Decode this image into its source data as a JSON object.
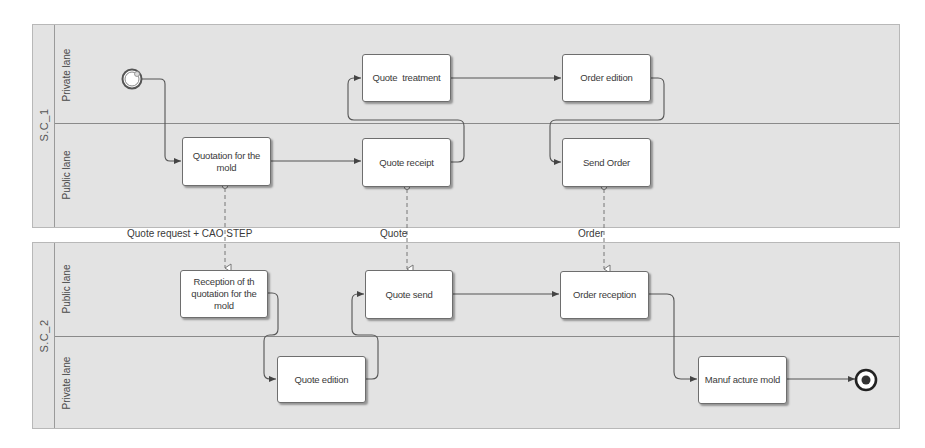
{
  "colors": {
    "pool_fill": "#e3e3e3",
    "task_fill": "#ffffff",
    "line": "#555555"
  },
  "pools": [
    {
      "id": "sc1",
      "title": "S.C_1",
      "lanes": [
        {
          "label": "Private lane"
        },
        {
          "label": "Public lane"
        }
      ]
    },
    {
      "id": "sc2",
      "title": "S.C_2",
      "lanes": [
        {
          "label": "Public lane"
        },
        {
          "label": "Private lane"
        }
      ]
    }
  ],
  "tasks": {
    "quotation_for_mold": "Quotation for the mold",
    "quote_treatment": "Quote  treatment",
    "quote_receipt": "Quote receipt",
    "order_edition": "Order edition",
    "send_order": "Send Order",
    "reception_quotation": "Reception of th quotation for the mold",
    "quote_edition": "Quote edition",
    "quote_send": "Quote send",
    "order_reception": "Order reception",
    "manufacture_mold": "Manuf acture mold"
  },
  "events": {
    "start": "start-event",
    "end": "end-event"
  },
  "message_flows": [
    {
      "label": "Quote request + CAO STEP",
      "from": "Quotation for the mold",
      "to": "Reception of th quotation for the mold"
    },
    {
      "label": "Quote",
      "from": "Quote receipt",
      "to": "Quote send"
    },
    {
      "label": "Order",
      "from": "Send Order",
      "to": "Order reception"
    }
  ]
}
